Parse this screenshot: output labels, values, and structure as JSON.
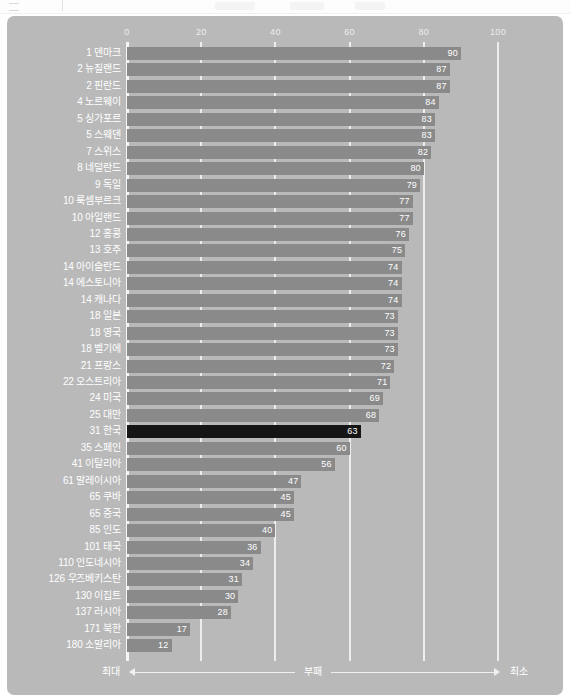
{
  "top_strip": {
    "hamburger_icon": "hamburger-icon"
  },
  "chart_data": {
    "type": "bar",
    "orientation": "horizontal",
    "title": "",
    "xlabel": "",
    "ylabel": "",
    "xlim": [
      0,
      100
    ],
    "xticks": [
      0,
      20,
      40,
      60,
      80,
      100
    ],
    "grid": true,
    "legend_position": "bottom",
    "highlight_category": "31 한국",
    "categories": [
      "1 덴마크",
      "2 뉴질랜드",
      "2 핀란드",
      "4 노르웨이",
      "5 싱가포르",
      "5 스웨덴",
      "7 스위스",
      "8 네덜란드",
      "9 독일",
      "10 룩셈부르크",
      "10 아일랜드",
      "12 홍콩",
      "13 호주",
      "14 아이슬란드",
      "14 에스토니아",
      "14 캐나다",
      "18 일본",
      "18 영국",
      "18 벨기에",
      "21 프랑스",
      "22 오스트리아",
      "24 미국",
      "25 대만",
      "31 한국",
      "35 스페인",
      "41 이탈리아",
      "61 말레이시아",
      "65 쿠바",
      "65 중국",
      "85 인도",
      "101 태국",
      "110 인도네시아",
      "126 우즈베키스탄",
      "130 이집트",
      "137 러시아",
      "171 북한",
      "180 소말리아"
    ],
    "values": [
      90,
      87,
      87,
      84,
      83,
      83,
      82,
      80,
      79,
      77,
      77,
      76,
      75,
      74,
      74,
      74,
      73,
      73,
      73,
      72,
      71,
      69,
      68,
      63,
      60,
      56,
      47,
      45,
      45,
      40,
      36,
      34,
      31,
      30,
      28,
      17,
      12
    ],
    "annotations": {
      "left_label": "최대",
      "center_label": "부패",
      "right_label": "최소"
    },
    "colors": {
      "panel_background": "#b9b9b9",
      "bar": "#8a8a8a",
      "bar_highlight": "#151515",
      "text": "#ffffff",
      "gridline": "#ededed"
    }
  }
}
